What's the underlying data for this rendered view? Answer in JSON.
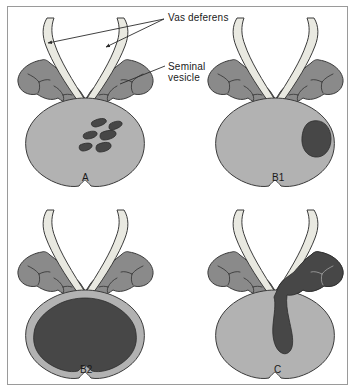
{
  "figure": {
    "border_color": "#9a9a9a",
    "background": "#ffffff"
  },
  "colors": {
    "prostate": "#b2b2b2",
    "prostate_outline": "#3b3b3b",
    "seminal_vesicle": "#8a8a8a",
    "seminal_vesicle_outline": "#3b3b3b",
    "vas_deferens": "#e9e9e1",
    "vas_deferens_outline": "#3b3b3b",
    "tumor": "#474747",
    "leader_line": "#2b2b2b",
    "text": "#1a1a1a"
  },
  "annotations": [
    {
      "id": "vas-deferens",
      "label": "Vas deferens",
      "x": 168,
      "y": 12
    },
    {
      "id": "seminal-vesicle",
      "label_line1": "Seminal",
      "label_line2": "vesicle",
      "x": 168,
      "y": 61
    }
  ],
  "panels": [
    {
      "id": "A",
      "label": "A",
      "label_x": 82,
      "label_y": 172,
      "description": "Prostate with multiple small scattered tumor foci",
      "tumor_type": "multifocal-small-foci",
      "tumor_count": 6
    },
    {
      "id": "B1",
      "label": "B1",
      "label_x": 272,
      "label_y": 172,
      "description": "Prostate with single unilateral tumor nodule",
      "tumor_type": "single-nodule",
      "tumor_count": 1
    },
    {
      "id": "B2",
      "label": "B2",
      "label_x": 80,
      "label_y": 364,
      "description": "Prostate largely replaced by tumor, confined to gland",
      "tumor_type": "diffuse-confined",
      "tumor_count": 1
    },
    {
      "id": "C",
      "label": "C",
      "label_x": 274,
      "label_y": 364,
      "description": "Tumor extending beyond prostate into right seminal vesicle",
      "tumor_type": "extracapsular-seminal-vesicle-invasion",
      "tumor_count": 1
    }
  ]
}
